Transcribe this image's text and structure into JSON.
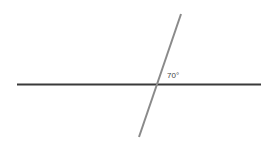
{
  "diagram": {
    "type": "intersecting-lines",
    "horizontal_line": {
      "x1": 17,
      "y1": 84.5,
      "x2": 261,
      "y2": 84.5,
      "color": "#3a3a3a",
      "width": 2
    },
    "transversal_line": {
      "x1": 181,
      "y1": 14,
      "x2": 139,
      "y2": 137,
      "color": "#8a8a8a",
      "width": 2
    },
    "angle_label": {
      "text": "70°",
      "x": 167,
      "y": 78
    }
  }
}
